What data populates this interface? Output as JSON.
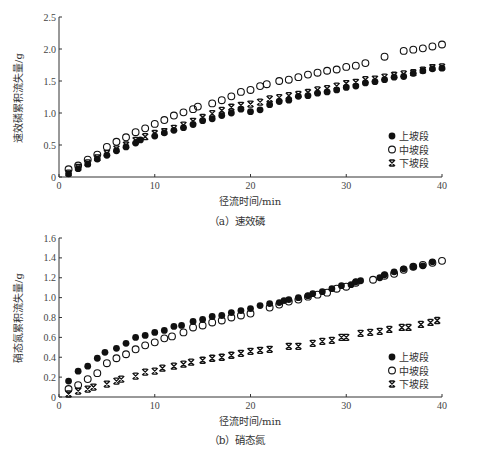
{
  "chart_data": [
    {
      "type": "scatter",
      "panel": "a",
      "caption": "（a）速效磷",
      "xlabel": "径流时间/min",
      "ylabel": "速效磷累积流失量/g",
      "xlim": [
        0,
        40
      ],
      "ylim": [
        0,
        2.5
      ],
      "xticks": [
        "0",
        "10",
        "20",
        "30",
        "40"
      ],
      "yticks": [
        "0",
        "0.5",
        "1.0",
        "1.5",
        "2.0",
        "2.5"
      ],
      "ytick_values": [
        0,
        0.5,
        1.0,
        1.5,
        2.0,
        2.5
      ],
      "grid": false,
      "legend_position": "lower right",
      "series": [
        {
          "name": "上坡段",
          "marker": "filled-circle",
          "x": [
            1,
            2,
            3,
            4,
            5,
            6,
            7,
            8,
            8.5,
            10,
            11,
            12,
            13,
            14,
            15,
            16,
            17,
            18,
            19,
            20,
            21,
            22,
            23,
            24,
            25,
            26,
            27,
            28,
            29,
            30,
            31,
            32,
            33,
            34,
            35,
            36,
            37,
            38,
            39,
            40
          ],
          "y": [
            0.05,
            0.13,
            0.2,
            0.28,
            0.34,
            0.41,
            0.47,
            0.53,
            0.58,
            0.64,
            0.69,
            0.73,
            0.77,
            0.82,
            0.88,
            0.91,
            0.96,
            1.0,
            1.06,
            1.02,
            1.05,
            1.13,
            1.18,
            1.2,
            1.26,
            1.27,
            1.31,
            1.33,
            1.36,
            1.4,
            1.42,
            1.47,
            1.49,
            1.52,
            1.56,
            1.57,
            1.62,
            1.66,
            1.69,
            1.7
          ]
        },
        {
          "name": "中坡段",
          "marker": "open-circle",
          "x": [
            1,
            2,
            3,
            4,
            5,
            6,
            7,
            8,
            9,
            10,
            11,
            12,
            13,
            14,
            14.5,
            16,
            17,
            18,
            19,
            20,
            21,
            21.7,
            23,
            24,
            25,
            26,
            27,
            28,
            29,
            30,
            31,
            32,
            34,
            36,
            37,
            38,
            39,
            40
          ],
          "y": [
            0.12,
            0.18,
            0.27,
            0.35,
            0.47,
            0.55,
            0.62,
            0.7,
            0.76,
            0.83,
            0.89,
            0.96,
            1.01,
            1.06,
            1.1,
            1.15,
            1.2,
            1.26,
            1.33,
            1.36,
            1.42,
            1.45,
            1.5,
            1.52,
            1.56,
            1.6,
            1.63,
            1.66,
            1.68,
            1.72,
            1.74,
            1.78,
            1.88,
            1.97,
            1.99,
            2.01,
            2.04,
            2.07
          ]
        },
        {
          "name": "下坡段",
          "marker": "x-bowtie",
          "x": [
            1,
            2,
            3,
            4,
            5,
            6,
            7,
            8,
            9,
            10,
            11,
            12,
            13,
            14,
            15,
            16,
            17,
            18,
            19,
            20,
            21,
            22,
            23,
            24,
            25,
            26,
            27,
            28,
            29,
            30,
            31,
            32,
            33,
            34,
            35,
            36,
            37,
            38,
            39,
            40
          ],
          "y": [
            0.06,
            0.15,
            0.22,
            0.3,
            0.37,
            0.44,
            0.5,
            0.57,
            0.63,
            0.68,
            0.71,
            0.76,
            0.81,
            0.87,
            0.93,
            0.99,
            1.04,
            1.09,
            1.12,
            1.14,
            1.17,
            1.22,
            1.24,
            1.27,
            1.29,
            1.32,
            1.36,
            1.38,
            1.42,
            1.46,
            1.48,
            1.52,
            1.53,
            1.56,
            1.59,
            1.61,
            1.63,
            1.67,
            1.71,
            1.72
          ]
        }
      ]
    },
    {
      "type": "scatter",
      "panel": "b",
      "caption": "（b）硝态氮",
      "xlabel": "径流时间/min",
      "ylabel": "硝态氮累积流失量/g",
      "xlim": [
        0,
        40
      ],
      "ylim": [
        0,
        1.6
      ],
      "xticks": [
        "0",
        "10",
        "20",
        "30",
        "40"
      ],
      "yticks": [
        "0",
        "0.2",
        "0.4",
        "0.6",
        "0.8",
        "1.0",
        "1.2",
        "1.4",
        "1.6"
      ],
      "ytick_values": [
        0,
        0.2,
        0.4,
        0.6,
        0.8,
        1.0,
        1.2,
        1.4,
        1.6
      ],
      "grid": false,
      "legend_position": "lower right",
      "series": [
        {
          "name": "上坡段",
          "marker": "filled-circle",
          "x": [
            1,
            2,
            3,
            4,
            4.8,
            6,
            7,
            8,
            9,
            10,
            11,
            12,
            12.8,
            14,
            15,
            16,
            17,
            18,
            19,
            20,
            21,
            22,
            23,
            23.5,
            24,
            25,
            26,
            26.5,
            27.5,
            28.5,
            29.5,
            30.5,
            31,
            31.5,
            33.5,
            34,
            35,
            36,
            37,
            38,
            39
          ],
          "y": [
            0.16,
            0.26,
            0.31,
            0.39,
            0.45,
            0.49,
            0.54,
            0.6,
            0.62,
            0.65,
            0.67,
            0.71,
            0.72,
            0.76,
            0.78,
            0.81,
            0.82,
            0.85,
            0.87,
            0.89,
            0.92,
            0.94,
            0.95,
            0.97,
            0.98,
            1.0,
            1.02,
            1.04,
            1.06,
            1.09,
            1.12,
            1.13,
            1.16,
            1.17,
            1.2,
            1.23,
            1.26,
            1.29,
            1.31,
            1.32,
            1.36
          ]
        },
        {
          "name": "中坡段",
          "marker": "open-circle",
          "x": [
            1,
            2,
            3,
            4,
            5,
            6,
            7,
            8,
            9,
            10,
            11,
            11.8,
            13,
            14,
            15,
            16,
            17,
            18,
            19,
            20,
            22,
            23,
            24,
            25,
            26,
            27,
            28,
            29,
            30,
            31,
            32.8,
            34,
            35,
            36,
            37,
            38,
            39,
            40
          ],
          "y": [
            0.08,
            0.12,
            0.18,
            0.24,
            0.34,
            0.39,
            0.43,
            0.48,
            0.52,
            0.55,
            0.59,
            0.61,
            0.65,
            0.7,
            0.72,
            0.75,
            0.77,
            0.8,
            0.82,
            0.84,
            0.9,
            0.93,
            0.96,
            0.98,
            1.01,
            1.03,
            1.05,
            1.09,
            1.11,
            1.15,
            1.18,
            1.22,
            1.24,
            1.28,
            1.31,
            1.33,
            1.35,
            1.37
          ]
        },
        {
          "name": "下坡段",
          "marker": "x-bowtie",
          "x": [
            1,
            2,
            3,
            3.6,
            5,
            6,
            6.5,
            8,
            9,
            10,
            10.8,
            12,
            13,
            13.8,
            15,
            16,
            17,
            18,
            19,
            20,
            21,
            22,
            24,
            25,
            26.5,
            27.5,
            28.5,
            29.5,
            30,
            31.5,
            32.5,
            33.5,
            34.5,
            35.8,
            36.5,
            37.8,
            38.8,
            39.5
          ],
          "y": [
            0.03,
            0.06,
            0.08,
            0.1,
            0.13,
            0.16,
            0.18,
            0.21,
            0.25,
            0.26,
            0.29,
            0.31,
            0.33,
            0.35,
            0.37,
            0.39,
            0.4,
            0.42,
            0.44,
            0.46,
            0.47,
            0.48,
            0.51,
            0.51,
            0.54,
            0.56,
            0.57,
            0.6,
            0.6,
            0.64,
            0.65,
            0.66,
            0.68,
            0.7,
            0.7,
            0.73,
            0.75,
            0.77
          ]
        }
      ]
    }
  ],
  "legend": {
    "items": [
      "上坡段",
      "中坡段",
      "下坡段"
    ]
  },
  "style": {
    "marker_color": "#111111",
    "axis_color": "#333333"
  }
}
